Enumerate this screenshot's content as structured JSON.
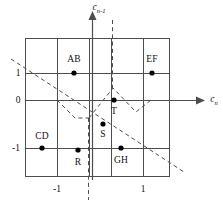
{
  "figure": {
    "type": "state-space-partition-diagram",
    "axes": {
      "x_label": "c",
      "x_label_sub": "n",
      "y_label": "c",
      "y_label_sub": "n-1",
      "x_ticks": [
        "-1",
        "1"
      ],
      "y_ticks": [
        "1",
        "0",
        "-1"
      ]
    },
    "region_labels": [
      {
        "text": "AB",
        "x": 74,
        "y": 60
      },
      {
        "text": "EF",
        "x": 152,
        "y": 60
      },
      {
        "text": "T",
        "x": 114,
        "y": 112
      },
      {
        "text": "CD",
        "x": 42,
        "y": 137
      },
      {
        "text": "S",
        "x": 103,
        "y": 135
      },
      {
        "text": "GH",
        "x": 121,
        "y": 161
      },
      {
        "text": "R",
        "x": 78,
        "y": 163
      }
    ],
    "points": [
      {
        "label": "AB",
        "x": 74,
        "y": 73
      },
      {
        "label": "EF",
        "x": 152,
        "y": 73
      },
      {
        "label": "T",
        "x": 114,
        "y": 100
      },
      {
        "label": "S",
        "x": 103,
        "y": 124
      },
      {
        "label": "CD",
        "x": 42,
        "y": 148
      },
      {
        "label": "GH",
        "x": 121,
        "y": 148
      },
      {
        "label": "R",
        "x": 78,
        "y": 150
      }
    ],
    "colors": {
      "line": "#4d4d4d",
      "axis": "#4d4d4d",
      "dashed": "#4d4d4d",
      "dot": "#000000",
      "text": "#111111",
      "background": "#ffffff"
    },
    "grid": {
      "x_lines": [
        25,
        57,
        89,
        111,
        143,
        170
      ],
      "y_lines": [
        38,
        73,
        100,
        123,
        148,
        177
      ]
    }
  }
}
